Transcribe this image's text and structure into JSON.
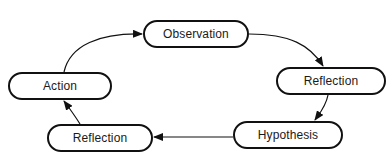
{
  "diagram": {
    "type": "cycle",
    "nodes": [
      {
        "id": "observation",
        "label": "Observation",
        "x": 143,
        "y": 20,
        "w": 106,
        "h": 28
      },
      {
        "id": "reflection_right",
        "label": "Reflection",
        "x": 276,
        "y": 67,
        "w": 110,
        "h": 28
      },
      {
        "id": "hypothesis",
        "label": "Hypothesis",
        "x": 233,
        "y": 121,
        "w": 110,
        "h": 28
      },
      {
        "id": "reflection_left",
        "label": "Reflection",
        "x": 47,
        "y": 124,
        "w": 106,
        "h": 28
      },
      {
        "id": "action",
        "label": "Action",
        "x": 8,
        "y": 72,
        "w": 104,
        "h": 28
      }
    ],
    "edges": [
      {
        "from": "observation",
        "to": "reflection_right"
      },
      {
        "from": "reflection_right",
        "to": "hypothesis"
      },
      {
        "from": "hypothesis",
        "to": "reflection_left"
      },
      {
        "from": "reflection_left",
        "to": "action"
      },
      {
        "from": "action",
        "to": "observation"
      }
    ],
    "colors": {
      "stroke": "#111111",
      "background": "#ffffff",
      "text": "#1a1a1a"
    }
  }
}
